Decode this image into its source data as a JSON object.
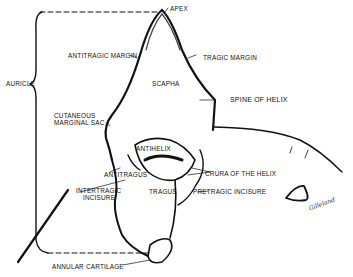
{
  "diagram": {
    "labels": {
      "apex": "APEX",
      "antitragic_margin": "ANTITRAGIC MARGIN",
      "tragic_margin": "TRAGIC MARGIN",
      "auricle": "AURICLE",
      "scapha": "SCAPHA",
      "spine_of_helix": "SPINE OF HELIX",
      "cutaneous_marginal_sac_1": "CUTANEOUS",
      "cutaneous_marginal_sac_2": "MARGINAL SAC",
      "antihelix": "ANTIHELIX",
      "antitragus": "ANTITRAGUS",
      "crura_of_the_helix": "CRURA OF THE HELIX",
      "intertragic_incisure_1": "INTERTRAGIC",
      "intertragic_incisure_2": "INCISURE",
      "tragus": "TRAGUS",
      "pretragic_incisure": "PRETRAGIC INCISURE",
      "annular_cartilage": "ANNULAR CARTILAGE"
    },
    "signature": "Gilleland",
    "colors": {
      "line": "#111111",
      "background": "#ffffff"
    }
  }
}
